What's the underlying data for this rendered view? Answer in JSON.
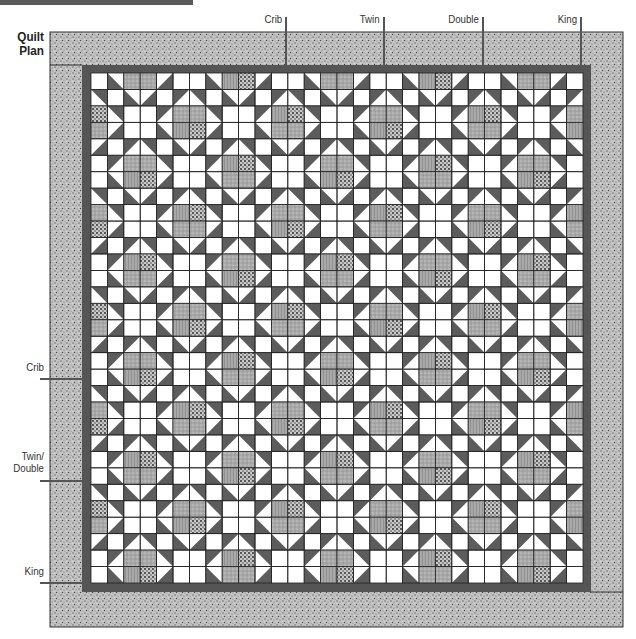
{
  "title": {
    "line1": "Quilt",
    "line2": "Plan"
  },
  "size_markers": {
    "top": [
      {
        "label": "Crib",
        "x": 286
      },
      {
        "label": "Twin",
        "x": 384
      },
      {
        "label": "Double",
        "x": 483
      },
      {
        "label": "King",
        "x": 581
      }
    ],
    "left": [
      {
        "label": "Crib",
        "y": 379
      },
      {
        "label": "Twin/",
        "label2": "Double",
        "y": 481
      },
      {
        "label": "King",
        "y": 583
      }
    ]
  },
  "quilt": {
    "outer_border": {
      "x": 50,
      "y": 32,
      "w": 573,
      "h": 595
    },
    "inner_border": {
      "x": 82,
      "y": 65,
      "w": 509,
      "h": 527
    },
    "grid": {
      "x": 91,
      "y": 73,
      "cols": 30,
      "rows": 31,
      "cell": 16.36
    },
    "pattern": "Star and Square-in-a-Square alternating blocks, 3-cell repeat",
    "colors": {
      "outer_border": "#b8b8b8",
      "inner_border": "#555555",
      "white": "#ffffff",
      "star_point": "#5c5c5c",
      "print_a": "#a9a9a9",
      "print_b": "#9a9a9a",
      "grid_line": "#222222"
    }
  }
}
